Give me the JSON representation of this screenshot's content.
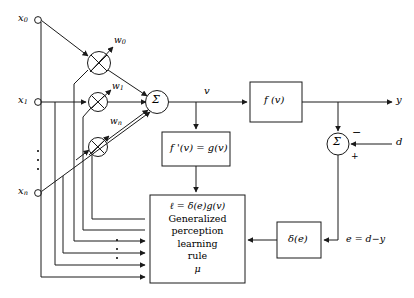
{
  "diagram": {
    "type": "block-diagram",
    "line_color": "#1a1a1a",
    "background": "#ffffff"
  },
  "inputs": [
    {
      "id": "x0",
      "base": "x",
      "sub": "0",
      "x": 22,
      "y": 20
    },
    {
      "id": "x1",
      "base": "x",
      "sub": "1",
      "x": 22,
      "y": 102
    },
    {
      "id": "xn",
      "base": "x",
      "sub": "n",
      "x": 22,
      "y": 193
    }
  ],
  "weights": [
    {
      "id": "w0",
      "base": "w",
      "sub": "0",
      "x": 115,
      "y": 41
    },
    {
      "id": "w1",
      "base": "w",
      "sub": "1",
      "x": 113,
      "y": 86
    },
    {
      "id": "wn",
      "base": "w",
      "sub": "n",
      "x": 111,
      "y": 121
    }
  ],
  "nodes": {
    "multiplier_symbol": "×",
    "sum_symbol": "Σ",
    "minus_sign": "−",
    "plus_sign": "+"
  },
  "blocks": {
    "activation": {
      "label": "f (v)",
      "x": 250,
      "y": 82,
      "w": 52,
      "h": 40
    },
    "derivative": {
      "label": "f '(v) = g(v)",
      "x": 162,
      "y": 132,
      "h": 34,
      "w": 68
    },
    "delta": {
      "label": "δ(e)",
      "x": 277,
      "y": 222,
      "w": 44,
      "h": 36
    },
    "learning_rule": {
      "x": 150,
      "y": 195,
      "w": 95,
      "h": 88,
      "lines": [
        "ℓ = δ(e)g(v)",
        "Generalized",
        "perception",
        "learning",
        "rule",
        "μ"
      ]
    }
  },
  "signals": {
    "v": "v",
    "y": "y",
    "d": "d",
    "error": "e = d−y"
  }
}
